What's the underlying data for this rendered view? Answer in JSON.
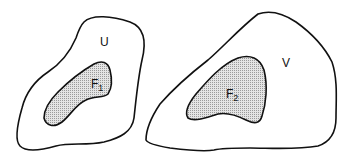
{
  "diagram": {
    "regions": [
      {
        "id": "U",
        "label": "U",
        "type": "outer-set",
        "contains": "F1"
      },
      {
        "id": "F1",
        "label": "F",
        "subscript": "1",
        "type": "inner-set",
        "shaded": true
      },
      {
        "id": "V",
        "label": "V",
        "type": "outer-set",
        "contains": "F2"
      },
      {
        "id": "F2",
        "label": "F",
        "subscript": "2",
        "type": "inner-set",
        "shaded": true
      }
    ],
    "colors": {
      "stroke": "#111111",
      "shade": "#c8c8c8",
      "background": "#ffffff"
    }
  }
}
